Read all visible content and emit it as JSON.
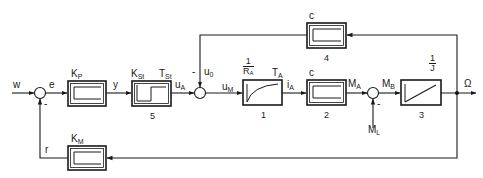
{
  "diagram": {
    "type": "control-loop block diagram",
    "colors": {
      "line": "#1a1a1a",
      "background": "#ffffff"
    },
    "signals": {
      "w": "w",
      "e": "e",
      "y": "y",
      "uA": {
        "main": "u",
        "sub": "A"
      },
      "u0": {
        "main": "u",
        "sub": "0"
      },
      "uM": {
        "main": "u",
        "sub": "M"
      },
      "iA": {
        "main": "i",
        "sub": "A"
      },
      "MA": {
        "main": "M",
        "sub": "A"
      },
      "MB": {
        "main": "M",
        "sub": "B"
      },
      "ML": {
        "main": "M",
        "sub": "L"
      },
      "omega": "Ω",
      "r": "r"
    },
    "blocks": {
      "kp": {
        "gain": {
          "main": "K",
          "sub": "P"
        },
        "response": "proportional"
      },
      "kst": {
        "gain": {
          "main": "K",
          "sub": "St"
        },
        "time": {
          "main": "T",
          "sub": "St"
        },
        "number": "5",
        "response": "dead-time step"
      },
      "b1": {
        "gain_num": "1",
        "gain_den": {
          "main": "R",
          "sub": "A"
        },
        "time": {
          "main": "T",
          "sub": "A"
        },
        "number": "1",
        "response": "first-order lag"
      },
      "b2": {
        "gain": "c",
        "number": "2",
        "response": "proportional"
      },
      "b3": {
        "gain_num": "1",
        "gain_den": "J",
        "number": "3",
        "response": "integrator"
      },
      "b4": {
        "gain": "c",
        "number": "4",
        "response": "proportional"
      },
      "km": {
        "gain": {
          "main": "K",
          "sub": "M"
        },
        "response": "proportional"
      }
    },
    "junctions": {
      "s1": {
        "minus_sign": "-"
      },
      "s2": {
        "minus_sign": "-"
      },
      "s3": {
        "minus_sign": "-"
      }
    }
  }
}
